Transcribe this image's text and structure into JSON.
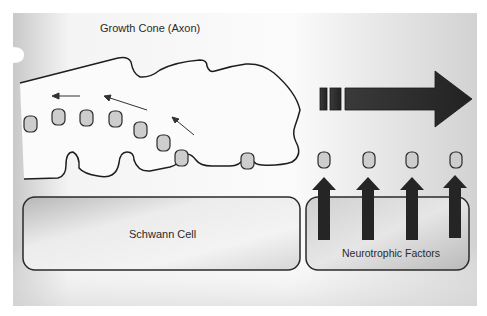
{
  "diagram": {
    "labels": {
      "growth_cone": "Growth Cone (Axon)",
      "schwann_cell": "Schwann Cell",
      "neurotrophic_factors": "Neurotrophic Factors"
    },
    "colors": {
      "background_light": "#fafafa",
      "background_dark": "#cfcfcf",
      "outline": "#1e1e1e",
      "vesicle_fill": "#cdcdcd",
      "arrow_fill": "#2b2b2b",
      "box_fill_light": "#f2f2f2",
      "box_fill_dark": "#b8b8b8"
    },
    "elements": {
      "vesicles_in_cone": 9,
      "factor_vesicles": 4,
      "upward_arrows": 4,
      "internal_arrows": 3,
      "direction_arrow": "right"
    }
  }
}
